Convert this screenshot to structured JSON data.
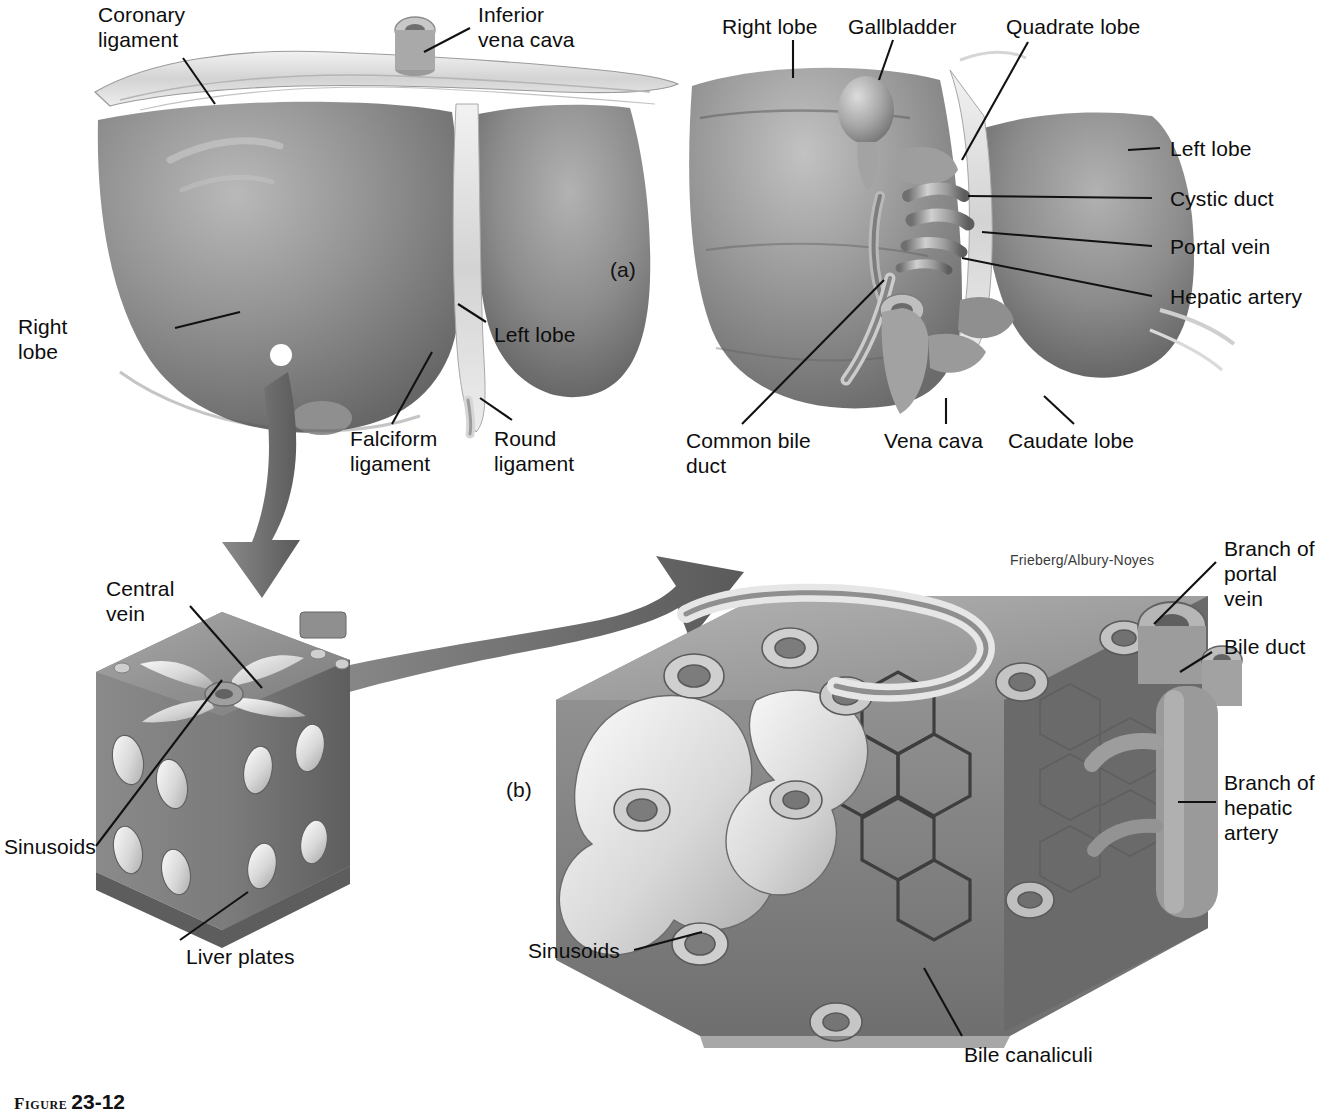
{
  "figure": {
    "caption_word": "Figure",
    "caption_number": "23-12",
    "credit": "Frieberg/Albury-Noyes"
  },
  "panels": [
    {
      "id": "a",
      "marker": "(a)"
    },
    {
      "id": "b",
      "marker": "(b)"
    }
  ],
  "labels": {
    "liver_anterior": [
      {
        "name": "coronary-ligament",
        "text": "Coronary\nligament"
      },
      {
        "name": "inferior-vena-cava",
        "text": "Inferior\nvena cava"
      },
      {
        "name": "right-lobe",
        "text": "Right\nlobe"
      },
      {
        "name": "left-lobe",
        "text": "Left lobe"
      },
      {
        "name": "falciform-ligament",
        "text": "Falciform\nligament"
      },
      {
        "name": "round-ligament",
        "text": "Round\nligament"
      }
    ],
    "liver_inferior": [
      {
        "name": "right-lobe",
        "text": "Right lobe"
      },
      {
        "name": "gallbladder",
        "text": "Gallbladder"
      },
      {
        "name": "quadrate-lobe",
        "text": "Quadrate lobe"
      },
      {
        "name": "left-lobe",
        "text": "Left lobe"
      },
      {
        "name": "cystic-duct",
        "text": "Cystic duct"
      },
      {
        "name": "portal-vein",
        "text": "Portal vein"
      },
      {
        "name": "hepatic-artery",
        "text": "Hepatic artery"
      },
      {
        "name": "common-bile-duct",
        "text": "Common bile\nduct"
      },
      {
        "name": "vena-cava",
        "text": "Vena cava"
      },
      {
        "name": "caudate-lobe",
        "text": "Caudate lobe"
      }
    ],
    "lobule": [
      {
        "name": "central-vein",
        "text": "Central\nvein"
      },
      {
        "name": "sinusoids",
        "text": "Sinusoids"
      },
      {
        "name": "liver-plates",
        "text": "Liver plates"
      }
    ],
    "lobule_detail": [
      {
        "name": "branch-of-portal-vein",
        "text": "Branch of\nportal\nvein"
      },
      {
        "name": "bile-duct",
        "text": "Bile duct"
      },
      {
        "name": "branch-of-hepatic-artery",
        "text": "Branch of\nhepatic\nartery"
      },
      {
        "name": "sinusoids",
        "text": "Sinusoids"
      },
      {
        "name": "bile-canaliculi",
        "text": "Bile canaliculi"
      }
    ]
  },
  "colors": {
    "ink": "#111111",
    "paper": "#ffffff",
    "tissue_mid": "#8d8d8d",
    "tissue_dark": "#636363",
    "tissue_light": "#bdbdbd",
    "arrow": "#6a6a6a"
  }
}
